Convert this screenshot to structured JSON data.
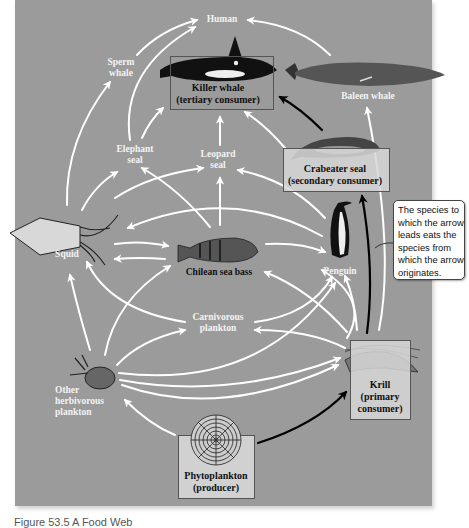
{
  "diagram": {
    "type": "food-web",
    "nodes": {
      "human": {
        "label": "Human"
      },
      "sperm_whale": {
        "line1": "Sperm",
        "line2": "whale"
      },
      "killer_whale": {
        "line1": "Killer whale",
        "line2": "(tertiary consumer)"
      },
      "baleen_whale": {
        "label": "Baleen whale"
      },
      "elephant_seal": {
        "line1": "Elephant",
        "line2": "seal"
      },
      "leopard_seal": {
        "line1": "Leopard",
        "line2": "seal"
      },
      "crabeater_seal": {
        "line1": "Crabeater seal",
        "line2": "(secondary consumer)"
      },
      "squid": {
        "label": "Squid"
      },
      "chilean_sea_bass": {
        "label": "Chilean sea bass"
      },
      "penguin": {
        "label": "Penguin"
      },
      "carnivorous_plankton": {
        "line1": "Carnivorous",
        "line2": "plankton"
      },
      "other_herbivorous_plankton": {
        "line1": "Other",
        "line2": "herbivorous",
        "line3": "plankton"
      },
      "krill": {
        "line1": "Krill",
        "line2": "(primary",
        "line3": "consumer)"
      },
      "phytoplankton": {
        "line1": "Phytoplankton",
        "line2": "(producer)"
      }
    },
    "edges": [
      {
        "from": "Sperm whale",
        "to": "Human"
      },
      {
        "from": "Elephant seal",
        "to": "Human"
      },
      {
        "from": "Baleen whale",
        "to": "Human"
      },
      {
        "from": "Elephant seal",
        "to": "Killer whale"
      },
      {
        "from": "Leopard seal",
        "to": "Killer whale"
      },
      {
        "from": "Penguin",
        "to": "Killer whale"
      },
      {
        "from": "Crabeater seal",
        "to": "Killer whale",
        "highlight": true
      },
      {
        "from": "Krill",
        "to": "Baleen whale"
      },
      {
        "from": "Squid",
        "to": "Sperm whale"
      },
      {
        "from": "Squid",
        "to": "Elephant seal"
      },
      {
        "from": "Squid",
        "to": "Leopard seal"
      },
      {
        "from": "Chilean sea bass",
        "to": "Elephant seal"
      },
      {
        "from": "Chilean sea bass",
        "to": "Leopard seal"
      },
      {
        "from": "Penguin",
        "to": "Leopard seal"
      },
      {
        "from": "Penguin",
        "to": "Squid"
      },
      {
        "from": "Squid",
        "to": "Chilean sea bass"
      },
      {
        "from": "Chilean sea bass",
        "to": "Squid"
      },
      {
        "from": "Chilean sea bass",
        "to": "Penguin"
      },
      {
        "from": "Krill",
        "to": "Chilean sea bass"
      },
      {
        "from": "Krill",
        "to": "Crabeater seal",
        "highlight": true
      },
      {
        "from": "Krill",
        "to": "Penguin"
      },
      {
        "from": "Carnivorous plankton",
        "to": "Squid"
      },
      {
        "from": "Carnivorous plankton",
        "to": "Penguin"
      },
      {
        "from": "Krill",
        "to": "Carnivorous plankton"
      },
      {
        "from": "Other herbivorous plankton",
        "to": "Squid"
      },
      {
        "from": "Other herbivorous plankton",
        "to": "Chilean sea bass"
      },
      {
        "from": "Other herbivorous plankton",
        "to": "Carnivorous plankton"
      },
      {
        "from": "Other herbivorous plankton",
        "to": "Penguin"
      },
      {
        "from": "Other herbivorous plankton",
        "to": "Krill"
      },
      {
        "from": "Phytoplankton",
        "to": "Other herbivorous plankton"
      },
      {
        "from": "Phytoplankton",
        "to": "Krill",
        "highlight": true
      }
    ],
    "callout": {
      "line1": "The species to",
      "line2": "which the arrow",
      "line3": "leads eats the",
      "line4": "species from",
      "line5": "which the arrow",
      "line6": "originates."
    },
    "caption": "Figure 53.5 A Food Web",
    "colors": {
      "background": "#9b9b9b",
      "arrow": "#ffffff",
      "highlight_arrow": "#000000",
      "box_fill": "#cfcfcf"
    }
  }
}
